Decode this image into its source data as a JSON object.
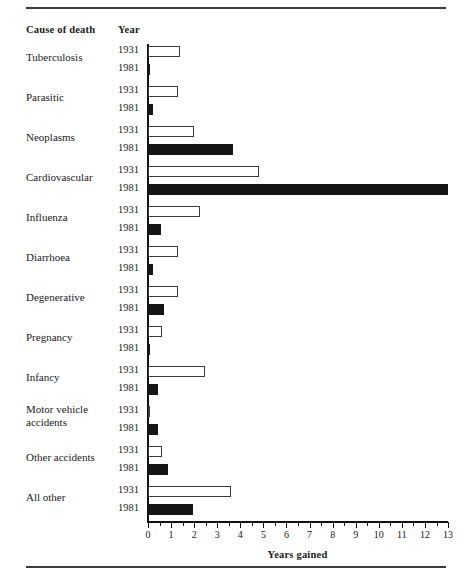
{
  "header": {
    "cause_label": "Cause of death",
    "year_label": "Year"
  },
  "axis": {
    "title": "Years gained",
    "tick_labels": [
      "0",
      "1",
      "2",
      "3",
      "4",
      "5",
      "6",
      "7",
      "8",
      "9",
      "10",
      "11",
      "12",
      "13"
    ]
  },
  "chart_data": {
    "type": "bar",
    "title": "",
    "subtitle": "",
    "xlabel": "Years gained",
    "ylabel": "Cause of death",
    "xlim": [
      0,
      13
    ],
    "grid": false,
    "orientation": "horizontal",
    "legend": "none",
    "major_tick_interval": 1,
    "minor_tick_interval": 0.5,
    "categories": [
      "Tuberculosis",
      "Parasitic",
      "Neoplasms",
      "Cardiovascular",
      "Influenza",
      "Diarrhoea",
      "Degenerative",
      "Pregnancy",
      "Infancy",
      "Motor vehicle\naccidents",
      "Other accidents",
      "All other"
    ],
    "series": [
      {
        "name": "1931",
        "values": [
          1.4,
          1.3,
          2.0,
          4.8,
          2.25,
          1.3,
          1.3,
          0.6,
          2.45,
          0.1,
          0.6,
          3.6
        ]
      },
      {
        "name": "1981",
        "values": [
          0.1,
          0.2,
          3.7,
          13.0,
          0.55,
          0.2,
          0.7,
          0.05,
          0.45,
          0.45,
          0.85,
          1.95
        ]
      }
    ]
  },
  "rows": [
    {
      "cause": "Tuberculosis",
      "y1931": 1.4,
      "y1981": 0.1
    },
    {
      "cause": "Parasitic",
      "y1931": 1.3,
      "y1981": 0.2
    },
    {
      "cause": "Neoplasms",
      "y1931": 2.0,
      "y1981": 3.7
    },
    {
      "cause": "Cardiovascular",
      "y1931": 4.8,
      "y1981": 13.0
    },
    {
      "cause": "Influenza",
      "y1931": 2.25,
      "y1981": 0.55
    },
    {
      "cause": "Diarrhoea",
      "y1931": 1.3,
      "y1981": 0.2
    },
    {
      "cause": "Degenerative",
      "y1931": 1.3,
      "y1981": 0.7
    },
    {
      "cause": "Pregnancy",
      "y1931": 0.6,
      "y1981": 0.05
    },
    {
      "cause": "Infancy",
      "y1931": 2.45,
      "y1981": 0.45
    },
    {
      "cause": "Motor vehicle\naccidents",
      "y1931": 0.1,
      "y1981": 0.45
    },
    {
      "cause": "Other accidents",
      "y1931": 0.6,
      "y1981": 0.85
    },
    {
      "cause": "All other",
      "y1931": 3.6,
      "y1981": 1.95
    }
  ],
  "year_labels": {
    "first": "1931",
    "second": "1981"
  }
}
